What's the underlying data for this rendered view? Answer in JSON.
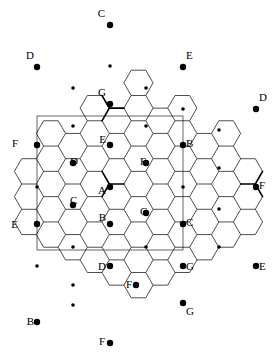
{
  "figure": {
    "width": 277,
    "height": 358,
    "background": "#ffffff",
    "stroke_color": "#000000",
    "thin_stroke": 0.7,
    "thick_stroke": 1.5,
    "domain_rect_stroke": 0.6,
    "node_radius_large": 3.2,
    "node_radius_small": 1.8,
    "top_artifact_text": "·  ·   ·    ·  ·     ·   ·  ·  ·   ·· ·    ·   ·   ·  ·"
  },
  "geometry": {
    "hex_radius": 14.6,
    "hex_orientation": "flat-top",
    "col_step": 21.9,
    "row_step": 25.3,
    "origin_x": 110,
    "origin_y": 25
  },
  "domain_rect": {
    "x": 37,
    "y": 116,
    "width": 146,
    "height": 134,
    "label": "fundamental-domain-rectangle"
  },
  "labels": [
    {
      "text": "C",
      "x": 105,
      "y": 17,
      "anchor": "end",
      "name": "vertex-label-C-top"
    },
    {
      "text": "D",
      "x": 34,
      "y": 59,
      "anchor": "end",
      "name": "vertex-label-D-upper-left"
    },
    {
      "text": "E",
      "x": 186,
      "y": 59,
      "anchor": "start",
      "name": "vertex-label-E-upper-right"
    },
    {
      "text": "G",
      "x": 106,
      "y": 96,
      "anchor": "end",
      "name": "vertex-label-G-upper-center"
    },
    {
      "text": "D",
      "x": 259,
      "y": 101,
      "anchor": "start",
      "name": "vertex-label-D-right"
    },
    {
      "text": "F",
      "x": 18,
      "y": 147,
      "anchor": "end",
      "name": "vertex-label-F-left"
    },
    {
      "text": "B",
      "x": 186,
      "y": 147,
      "anchor": "start",
      "name": "vertex-label-B-center-right"
    },
    {
      "text": "E",
      "x": 106,
      "y": 143,
      "anchor": "end",
      "name": "vertex-label-E-center"
    },
    {
      "text": "D",
      "x": 70,
      "y": 165,
      "anchor": "start",
      "name": "vertex-label-D-center-left"
    },
    {
      "text": "F",
      "x": 140,
      "y": 165,
      "anchor": "start",
      "name": "vertex-label-F-center"
    },
    {
      "text": "F",
      "x": 259,
      "y": 189,
      "anchor": "start",
      "name": "vertex-label-F-right"
    },
    {
      "text": "A",
      "x": 106,
      "y": 194,
      "anchor": "end",
      "name": "vertex-label-A-center"
    },
    {
      "text": "C",
      "x": 70,
      "y": 204,
      "anchor": "start",
      "name": "vertex-label-C-center-left"
    },
    {
      "text": "G",
      "x": 140,
      "y": 215,
      "anchor": "start",
      "name": "vertex-label-G-center"
    },
    {
      "text": "E",
      "x": 18,
      "y": 228,
      "anchor": "end",
      "name": "vertex-label-E-left"
    },
    {
      "text": "B",
      "x": 106,
      "y": 221,
      "anchor": "end",
      "name": "vertex-label-B-center"
    },
    {
      "text": "C",
      "x": 186,
      "y": 226,
      "anchor": "start",
      "name": "vertex-label-C-center-right"
    },
    {
      "text": "D",
      "x": 106,
      "y": 270,
      "anchor": "end",
      "name": "vertex-label-D-lower-center"
    },
    {
      "text": "G",
      "x": 186,
      "y": 270,
      "anchor": "start",
      "name": "vertex-label-G-lower-right"
    },
    {
      "text": "E",
      "x": 259,
      "y": 270,
      "anchor": "start",
      "name": "vertex-label-E-right"
    },
    {
      "text": "F",
      "x": 132,
      "y": 288,
      "anchor": "end",
      "name": "vertex-label-F-lower-center"
    },
    {
      "text": "G",
      "x": 186,
      "y": 315,
      "anchor": "start",
      "name": "vertex-label-G-bottom-right"
    },
    {
      "text": "B",
      "x": 34,
      "y": 325,
      "anchor": "end",
      "name": "vertex-label-B-bottom-left"
    },
    {
      "text": "F",
      "x": 105,
      "y": 345,
      "anchor": "end",
      "name": "vertex-label-F-bottom"
    }
  ],
  "large_nodes": [
    {
      "x": 110,
      "y": 25,
      "label": "C",
      "name": "node-C-top"
    },
    {
      "x": 37,
      "y": 67,
      "label": "D",
      "name": "node-D-upper-left"
    },
    {
      "x": 183,
      "y": 67,
      "label": "E",
      "name": "node-E-upper-right"
    },
    {
      "x": 110,
      "y": 104,
      "label": "G",
      "name": "node-G-upper-center"
    },
    {
      "x": 256,
      "y": 109,
      "label": "D",
      "name": "node-D-right"
    },
    {
      "x": 37,
      "y": 145,
      "label": "F",
      "name": "node-F-left"
    },
    {
      "x": 183,
      "y": 145,
      "label": "B",
      "name": "node-B-center-right"
    },
    {
      "x": 110,
      "y": 145,
      "label": "E",
      "name": "node-E-center"
    },
    {
      "x": 73,
      "y": 163,
      "label": "D",
      "name": "node-D-center-left"
    },
    {
      "x": 146,
      "y": 163,
      "label": "F",
      "name": "node-F-center"
    },
    {
      "x": 256,
      "y": 187,
      "label": "F",
      "name": "node-F-right"
    },
    {
      "x": 110,
      "y": 187,
      "label": "A",
      "name": "node-A-center"
    },
    {
      "x": 73,
      "y": 205,
      "label": "C",
      "name": "node-C-center-left"
    },
    {
      "x": 146,
      "y": 213,
      "label": "G",
      "name": "node-G-center"
    },
    {
      "x": 37,
      "y": 224,
      "label": "E",
      "name": "node-E-left"
    },
    {
      "x": 110,
      "y": 224,
      "label": "B",
      "name": "node-B-center"
    },
    {
      "x": 183,
      "y": 224,
      "label": "C",
      "name": "node-C-center-right"
    },
    {
      "x": 110,
      "y": 266,
      "label": "D",
      "name": "node-D-lower-center"
    },
    {
      "x": 183,
      "y": 266,
      "label": "G",
      "name": "node-G-lower-right"
    },
    {
      "x": 256,
      "y": 266,
      "label": "E",
      "name": "node-E-right"
    },
    {
      "x": 136,
      "y": 285,
      "label": "F",
      "name": "node-F-lower-center"
    },
    {
      "x": 183,
      "y": 303,
      "label": "G",
      "name": "node-G-bottom-right"
    },
    {
      "x": 37,
      "y": 322,
      "label": "B",
      "name": "node-B-bottom-left"
    },
    {
      "x": 110,
      "y": 343,
      "label": "F",
      "name": "node-F-bottom"
    }
  ],
  "small_nodes": [
    {
      "x": 73,
      "y": 88,
      "name": "node-small-1"
    },
    {
      "x": 146,
      "y": 88,
      "name": "node-small-2"
    },
    {
      "x": 183,
      "y": 109,
      "name": "node-small-3"
    },
    {
      "x": 73,
      "y": 126,
      "name": "node-small-4"
    },
    {
      "x": 146,
      "y": 126,
      "name": "node-small-5"
    },
    {
      "x": 219,
      "y": 130,
      "name": "node-small-6"
    },
    {
      "x": 37,
      "y": 187,
      "name": "node-small-7"
    },
    {
      "x": 183,
      "y": 187,
      "name": "node-small-8"
    },
    {
      "x": 219,
      "y": 168,
      "name": "node-small-9"
    },
    {
      "x": 73,
      "y": 247,
      "name": "node-small-10"
    },
    {
      "x": 146,
      "y": 247,
      "name": "node-small-11"
    },
    {
      "x": 219,
      "y": 247,
      "name": "node-small-12"
    },
    {
      "x": 37,
      "y": 266,
      "name": "node-small-13"
    },
    {
      "x": 73,
      "y": 285,
      "name": "node-small-14"
    },
    {
      "x": 219,
      "y": 209,
      "name": "node-small-15"
    },
    {
      "x": 110,
      "y": 66,
      "name": "node-small-16"
    },
    {
      "x": 73,
      "y": 305,
      "name": "node-small-17"
    }
  ],
  "legend": {
    "description": "Hexagonal (honeycomb) tiling with vertices labeled A through G; a rectangle marks the fundamental domain.",
    "vertex_labels": [
      "A",
      "B",
      "C",
      "D",
      "E",
      "F",
      "G"
    ]
  }
}
